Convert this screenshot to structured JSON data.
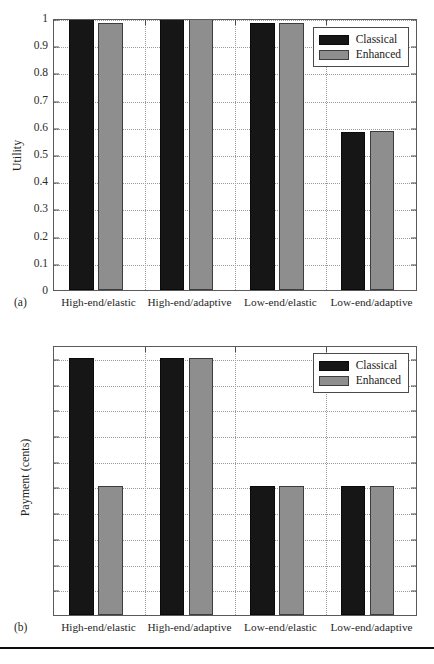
{
  "figure": {
    "panels": [
      {
        "tag": "(a)",
        "ylabel": "Utility",
        "yticks": [
          "1",
          "0.9",
          "0.8",
          "0.7",
          "0.6",
          "0.5",
          "0.4",
          "0.3",
          "0.2",
          "0.1",
          "0"
        ]
      },
      {
        "tag": "(b)",
        "ylabel": "Payment (cents)",
        "yticks": [
          "10",
          "9",
          "8",
          "7",
          "6",
          "5",
          "4",
          "3",
          "2",
          "1",
          "0"
        ]
      }
    ],
    "categories": [
      "High-end/elastic",
      "High-end/adaptive",
      "Low-end/elastic",
      "Low-end/adaptive"
    ],
    "legend": {
      "entries": [
        {
          "label": "Classical",
          "color": "#161616"
        },
        {
          "label": "Enhanced",
          "color": "#8e8e8e"
        }
      ]
    }
  },
  "chart_data": [
    {
      "type": "bar",
      "title": "",
      "panel_tag": "(a)",
      "categories": [
        "High-end/elastic",
        "High-end/adaptive",
        "Low-end/elastic",
        "Low-end/adaptive"
      ],
      "series": [
        {
          "name": "Classical",
          "color": "#161616",
          "values": [
            1.0,
            1.0,
            0.98,
            0.58
          ]
        },
        {
          "name": "Enhanced",
          "color": "#8e8e8e",
          "values": [
            0.98,
            1.0,
            0.98,
            0.585
          ]
        }
      ],
      "xlabel": "",
      "ylabel": "Utility",
      "ylim": [
        0,
        1
      ],
      "ytick_values": [
        1,
        0.9,
        0.8,
        0.7,
        0.6,
        0.5,
        0.4,
        0.3,
        0.2,
        0.1,
        0
      ],
      "grid": true,
      "legend_position": "top-right"
    },
    {
      "type": "bar",
      "title": "",
      "panel_tag": "(b)",
      "categories": [
        "High-end/elastic",
        "High-end/adaptive",
        "Low-end/elastic",
        "Low-end/adaptive"
      ],
      "series": [
        {
          "name": "Classical",
          "color": "#161616",
          "values": [
            10,
            10,
            5,
            5
          ]
        },
        {
          "name": "Enhanced",
          "color": "#8e8e8e",
          "values": [
            5,
            10,
            5,
            5
          ]
        }
      ],
      "xlabel": "",
      "ylabel": "Payment (cents)",
      "ylim": [
        0,
        10.5
      ],
      "ytick_values": [
        10,
        9,
        8,
        7,
        6,
        5,
        4,
        3,
        2,
        1,
        0
      ],
      "grid": true,
      "legend_position": "top-right"
    }
  ]
}
